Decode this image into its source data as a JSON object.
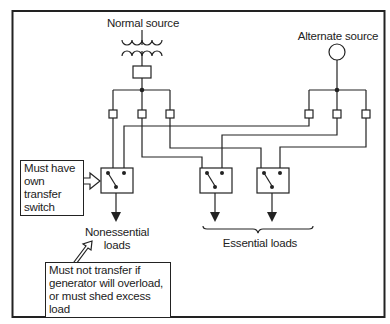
{
  "diagram": {
    "sources": {
      "normal": {
        "label": "Normal source",
        "symbol": "transformer"
      },
      "alternate": {
        "label": "Alternate source",
        "symbol": "generator-circle"
      }
    },
    "loads": {
      "nonessential": {
        "label_line1": "Nonessential",
        "label_line2": "loads"
      },
      "essential": {
        "label": "Essential loads",
        "switch_count": 2
      }
    },
    "notes": {
      "own_switch": {
        "line1": "Must have",
        "line2": "own transfer",
        "line3": "switch"
      },
      "no_transfer": {
        "line1": "Must not transfer if",
        "line2": "generator will overload,",
        "line3": "or must shed excess load"
      }
    },
    "colors": {
      "line": "#222222",
      "background": "#ffffff"
    }
  }
}
